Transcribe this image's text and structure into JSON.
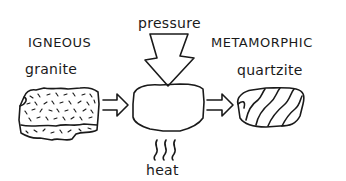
{
  "diagram": {
    "left": {
      "category": "IGNEOUS",
      "example": "granite"
    },
    "process": {
      "top_label": "pressure",
      "bottom_label": "heat"
    },
    "right": {
      "category": "METAMORPHIC",
      "example": "quartzite"
    },
    "icons": {
      "left_rock": "speckled-granite-rock",
      "center_rock": "blank-rock-under-transformation",
      "right_rock": "banded-quartzite-rock",
      "pressure_arrow": "down-arrow",
      "heat_symbol": "wavy-heat-lines",
      "flow_arrows": "right-arrow"
    },
    "colors": {
      "ink": "#1a1a1a",
      "background": "#ffffff"
    }
  }
}
